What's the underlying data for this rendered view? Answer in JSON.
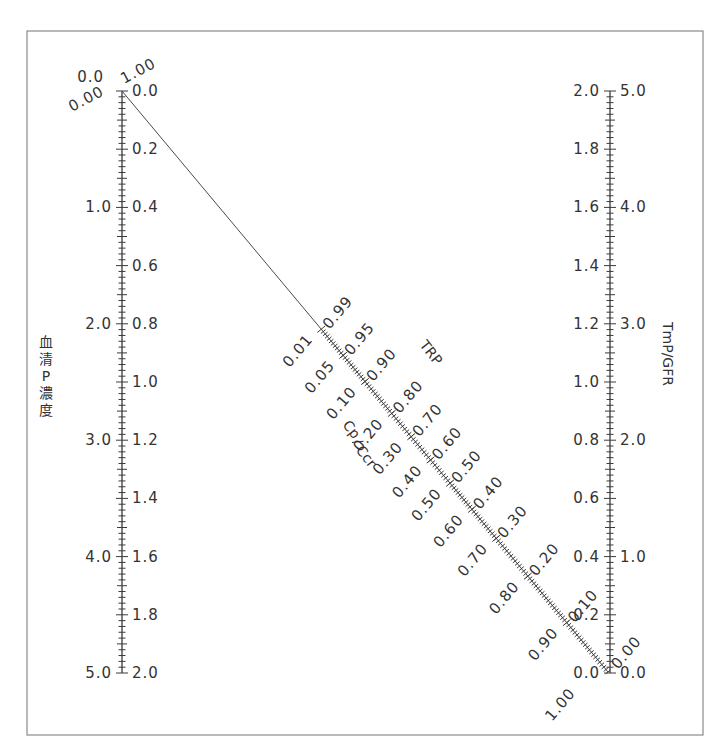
{
  "chart_data": {
    "type": "nomogram",
    "title": "",
    "frame": {
      "left": 27,
      "top": 31,
      "right": 703,
      "bottom": 735
    },
    "left_axis": {
      "x": 122,
      "y_top": 91,
      "y_bottom": 673,
      "title": "血清P濃度",
      "outer_labels": [
        "0.0",
        "1.0",
        "2.0",
        "3.0",
        "4.0",
        "5.0"
      ],
      "outer_range": [
        0.0,
        5.0
      ],
      "inner_labels": [
        "0.0",
        "0.2",
        "0.4",
        "0.6",
        "0.8",
        "1.0",
        "1.2",
        "1.4",
        "1.6",
        "1.8",
        "2.0"
      ],
      "inner_range": [
        0.0,
        2.0
      ],
      "minor_step": 0.02
    },
    "right_axis": {
      "x": 610,
      "y_top": 91,
      "y_bottom": 673,
      "title": "TmP/GFR",
      "outer_labels": [
        "2.0",
        "1.8",
        "1.6",
        "1.4",
        "1.2",
        "1.0",
        "0.8",
        "0.6",
        "0.4",
        "0.2",
        "0.0"
      ],
      "outer_range": [
        2.0,
        0.0
      ],
      "inner_labels": [
        "5.0",
        "4.0",
        "3.0",
        "2.0",
        "1.0",
        "0.0"
      ],
      "inner_range": [
        5.0,
        0.0
      ],
      "minor_step": 0.02
    },
    "diagonal_scale": {
      "start": [
        122,
        91
      ],
      "end": [
        608,
        672
      ],
      "left_title": "Cp/Ccr",
      "right_title": "TRP",
      "left_labels": [
        "0.00",
        "0.01",
        "0.05",
        "0.10",
        "0.20",
        "0.30",
        "0.40",
        "0.50",
        "0.60",
        "0.70",
        "0.80",
        "0.90",
        "1.00"
      ],
      "right_labels": [
        "1.00",
        "0.99",
        "0.95",
        "0.90",
        "0.80",
        "0.70",
        "0.60",
        "0.50",
        "0.40",
        "0.30",
        "0.20",
        "0.10",
        "0.00"
      ],
      "label_positions_t": [
        0.0,
        0.41,
        0.455,
        0.5,
        0.555,
        0.595,
        0.635,
        0.675,
        0.72,
        0.77,
        0.835,
        0.915,
        1.0
      ]
    },
    "top_left_labels": {
      "outer": "0.0",
      "diag_left": "0.00",
      "diag_right": "1.00",
      "inner": "0.0"
    },
    "bottom_right_labels": {
      "outer": "0.0",
      "diag_left": "1.00",
      "diag_right": "0.00",
      "inner": "0.0"
    }
  },
  "labels": {
    "left_title_chars": [
      "血",
      "清",
      "P",
      "濃",
      "度"
    ],
    "right_title": "TmP/GFR",
    "diag_left_title_main": "Cp",
    "diag_left_title_sub": "Ccr",
    "diag_right_title": "TRP"
  }
}
